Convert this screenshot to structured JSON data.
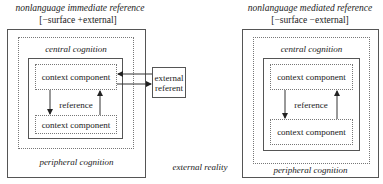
{
  "left_diagram": {
    "title": "nonlanguage immediate reference",
    "features": "[−surface +external]",
    "central_label": "central cognition",
    "peripheral_label": "peripheral cognition",
    "top_component": "context component",
    "bottom_component": "context component",
    "reference_label": "reference",
    "external_referent": [
      "external",
      "referent"
    ]
  },
  "right_diagram": {
    "title": "nonlanguage mediated reference",
    "features": "[−surface −external]",
    "central_label": "central cognition",
    "peripheral_label": "peripheral cognition",
    "top_component": "context component",
    "bottom_component": "context component",
    "reference_label": "reference"
  },
  "center_label": "external reality"
}
